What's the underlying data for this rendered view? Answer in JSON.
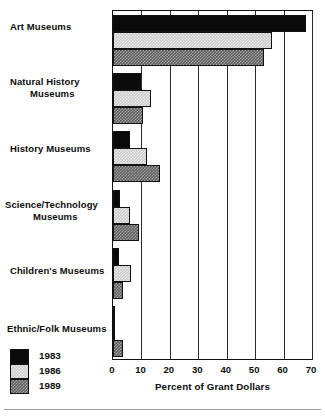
{
  "chart_data": {
    "type": "bar",
    "orientation": "horizontal",
    "title": "",
    "xlabel": "Percent of Grant Dollars",
    "ylabel": "",
    "xlim": [
      0,
      70
    ],
    "xticks": [
      0,
      10,
      20,
      30,
      40,
      50,
      60,
      70
    ],
    "xticklabels": [
      "0",
      "10",
      "20",
      "30",
      "40",
      "50",
      "60",
      "70"
    ],
    "grid": true,
    "legend_position": "bottom-left",
    "categories": [
      "Art Museums",
      "Natural History\nMuseums",
      "History Museums",
      "Science/Technology\nMuseums",
      "Children's Museums",
      "Ethnic/Folk Museums"
    ],
    "series": [
      {
        "name": "1983",
        "color": "#0a0a0a",
        "values": [
          68,
          10,
          6,
          2.5,
          2,
          0.7
        ]
      },
      {
        "name": "1986",
        "color": "#c9c9c9",
        "values": [
          56,
          13.5,
          12,
          6,
          6.5,
          0.5
        ]
      },
      {
        "name": "1989",
        "color": "#5c5c5c",
        "values": [
          53,
          10.5,
          16.5,
          9,
          3.5,
          3.5
        ]
      }
    ]
  },
  "axis": {
    "x_title": "Percent of Grant Dollars",
    "ticks": [
      "0",
      "10",
      "20",
      "30",
      "40",
      "50",
      "60",
      "70"
    ]
  },
  "categories": {
    "art": "Art Museums",
    "natural_history_line1": "Natural History",
    "natural_history_line2": "Museums",
    "history": "History Museums",
    "science_line1": "Science/Technology",
    "science_line2": "Museums",
    "childrens": "Children's Museums",
    "ethnic": "Ethnic/Folk Museums"
  },
  "legend": {
    "items": [
      {
        "label": "1983",
        "color": "#0a0a0a"
      },
      {
        "label": "1986",
        "color": "#c9c9c9"
      },
      {
        "label": "1989",
        "color": "#5c5c5c"
      }
    ]
  }
}
